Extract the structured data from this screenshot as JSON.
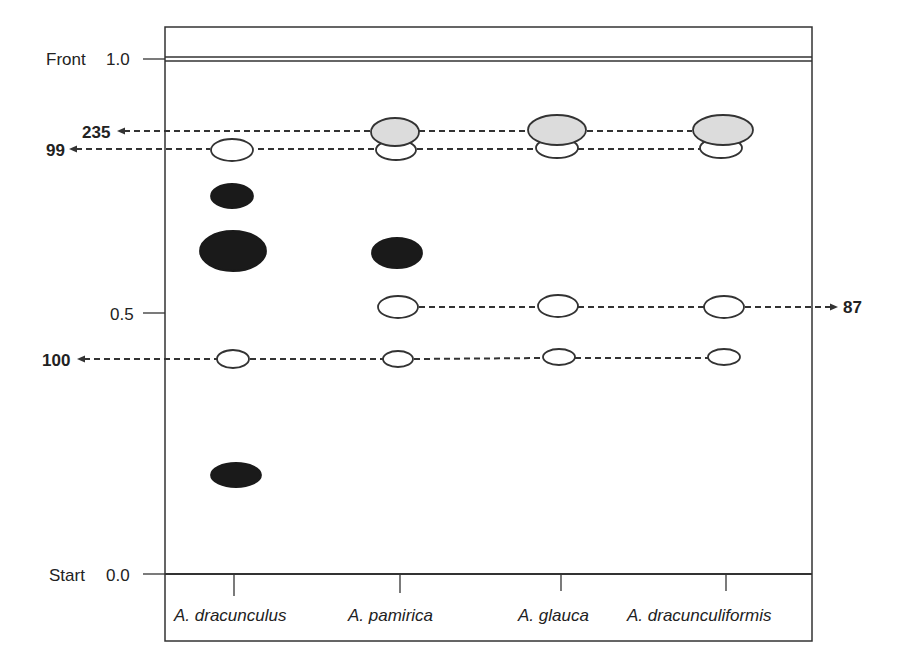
{
  "diagram": {
    "type": "tlc_plate",
    "colors": {
      "line": "#333333",
      "dark_spot": "#1a1a1a",
      "gray_spot": "#dcdcdc",
      "open_spot": "#ffffff"
    },
    "axis": {
      "front_label": "Front",
      "front_value": "1.0",
      "mid_value": "0.5",
      "start_label": "Start",
      "start_value": "0.0"
    },
    "lanes": [
      {
        "label": "A. dracunculus",
        "x": 234
      },
      {
        "label": "A. pamirica",
        "x": 400
      },
      {
        "label": "A. glauca",
        "x": 561
      },
      {
        "label": "A. dracunculiformis",
        "x": 726
      }
    ],
    "band_labels": [
      {
        "label": "235",
        "side": "left"
      },
      {
        "label": "99",
        "side": "left"
      },
      {
        "label": "87",
        "side": "right"
      },
      {
        "label": "100",
        "side": "left"
      }
    ],
    "spots": [
      {
        "lane": "A. dracunculus",
        "type": "open",
        "cx": 232,
        "cy": 150,
        "rx": 21,
        "ry": 11
      },
      {
        "lane": "A. dracunculus",
        "type": "dark",
        "cx": 232,
        "cy": 196,
        "rx": 21,
        "ry": 12
      },
      {
        "lane": "A. dracunculus",
        "type": "dark",
        "cx": 233,
        "cy": 251,
        "rx": 33,
        "ry": 20
      },
      {
        "lane": "A. dracunculus",
        "type": "open",
        "cx": 233,
        "cy": 359,
        "rx": 16,
        "ry": 9
      },
      {
        "lane": "A. dracunculus",
        "type": "dark",
        "cx": 236,
        "cy": 475,
        "rx": 25,
        "ry": 12
      },
      {
        "lane": "A. pamirica",
        "type": "open",
        "cx": 396,
        "cy": 150,
        "rx": 20,
        "ry": 10
      },
      {
        "lane": "A. pamirica",
        "type": "gray",
        "cx": 395,
        "cy": 132,
        "rx": 24,
        "ry": 14
      },
      {
        "lane": "A. pamirica",
        "type": "dark",
        "cx": 397,
        "cy": 253,
        "rx": 25,
        "ry": 15
      },
      {
        "lane": "A. pamirica",
        "type": "open",
        "cx": 398,
        "cy": 307,
        "rx": 20,
        "ry": 11
      },
      {
        "lane": "A. pamirica",
        "type": "open",
        "cx": 398,
        "cy": 359,
        "rx": 15,
        "ry": 8
      },
      {
        "lane": "A. glauca",
        "type": "open",
        "cx": 557,
        "cy": 148,
        "rx": 21,
        "ry": 10
      },
      {
        "lane": "A. glauca",
        "type": "gray",
        "cx": 557,
        "cy": 130,
        "rx": 29,
        "ry": 15
      },
      {
        "lane": "A. glauca",
        "type": "open",
        "cx": 558,
        "cy": 306,
        "rx": 20,
        "ry": 11
      },
      {
        "lane": "A. glauca",
        "type": "open",
        "cx": 559,
        "cy": 357,
        "rx": 16,
        "ry": 8
      },
      {
        "lane": "A. dracunculiformis",
        "type": "open",
        "cx": 721,
        "cy": 148,
        "rx": 21,
        "ry": 10
      },
      {
        "lane": "A. dracunculiformis",
        "type": "gray",
        "cx": 723,
        "cy": 130,
        "rx": 30,
        "ry": 15
      },
      {
        "lane": "A. dracunculiformis",
        "type": "open",
        "cx": 724,
        "cy": 307,
        "rx": 20,
        "ry": 11
      },
      {
        "lane": "A. dracunculiformis",
        "type": "open",
        "cx": 724,
        "cy": 357,
        "rx": 16,
        "ry": 8
      }
    ]
  }
}
